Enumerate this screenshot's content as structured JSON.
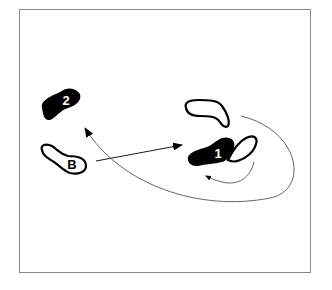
{
  "diagram": {
    "type": "dance-footwork",
    "footprints": [
      {
        "id": "B",
        "label": "B",
        "style": "outline"
      },
      {
        "id": "2",
        "label": "2",
        "style": "filled"
      },
      {
        "id": "1",
        "label": "1",
        "style": "filled"
      },
      {
        "id": "start-right",
        "label": "",
        "style": "outline"
      },
      {
        "id": "right-pivot",
        "label": "",
        "style": "outline"
      }
    ],
    "colors": {
      "ink": "#000000",
      "line": "#555555",
      "frame": "#8a8a8a"
    }
  }
}
